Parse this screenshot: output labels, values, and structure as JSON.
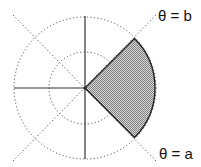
{
  "diagram": {
    "labels": {
      "upper_ray": "θ = b",
      "lower_ray": "θ = a"
    },
    "colors": {
      "axis": "#333333",
      "grid": "#555555",
      "fill": "#b4b4b4",
      "outline": "#222222",
      "background": "#ffffff"
    },
    "geometry": {
      "center": [
        85,
        88
      ],
      "inner_circle_radius": 36,
      "outer_circle_radius": 71,
      "sector_radius": 70,
      "ray_a_deg": -45,
      "ray_b_deg": 45
    }
  }
}
